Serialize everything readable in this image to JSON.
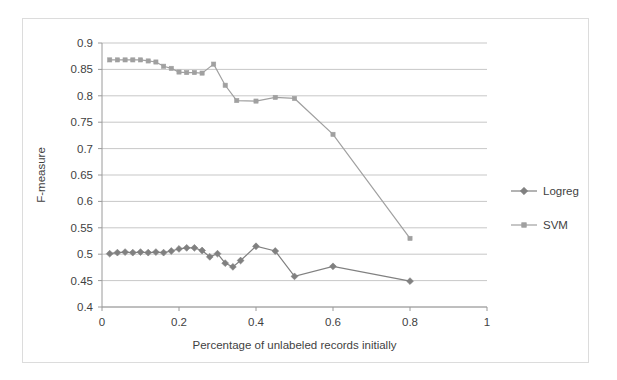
{
  "chart_data": {
    "type": "line",
    "title": "",
    "xlabel": "Percentage of unlabeled records initially",
    "ylabel": "F-measure",
    "xlim": [
      0,
      1
    ],
    "ylim": [
      0.4,
      0.9
    ],
    "xticks": [
      "0",
      "0.2",
      "0.4",
      "0.6",
      "0.8",
      "1"
    ],
    "xtick_values": [
      0,
      0.2,
      0.4,
      0.6,
      0.8,
      1
    ],
    "yticks": [
      "0.4",
      "0.45",
      "0.5",
      "0.55",
      "0.6",
      "0.65",
      "0.7",
      "0.75",
      "0.8",
      "0.85",
      "0.9"
    ],
    "ytick_values": [
      0.4,
      0.45,
      0.5,
      0.55,
      0.6,
      0.65,
      0.7,
      0.75,
      0.8,
      0.85,
      0.9
    ],
    "grid": "horizontal",
    "legend_position": "right",
    "series": [
      {
        "name": "Logreg",
        "marker": "diamond",
        "color": "#808080",
        "x": [
          0.02,
          0.04,
          0.06,
          0.08,
          0.1,
          0.12,
          0.14,
          0.16,
          0.18,
          0.2,
          0.22,
          0.24,
          0.26,
          0.28,
          0.3,
          0.32,
          0.34,
          0.36,
          0.4,
          0.45,
          0.5,
          0.6,
          0.8
        ],
        "y": [
          0.501,
          0.503,
          0.504,
          0.503,
          0.504,
          0.503,
          0.504,
          0.503,
          0.506,
          0.51,
          0.512,
          0.512,
          0.507,
          0.495,
          0.501,
          0.483,
          0.476,
          0.488,
          0.515,
          0.506,
          0.458,
          0.477,
          0.449
        ]
      },
      {
        "name": "SVM",
        "marker": "square",
        "color": "#a0a0a0",
        "x": [
          0.02,
          0.04,
          0.06,
          0.08,
          0.1,
          0.12,
          0.14,
          0.16,
          0.18,
          0.2,
          0.22,
          0.24,
          0.26,
          0.29,
          0.32,
          0.35,
          0.4,
          0.45,
          0.5,
          0.6,
          0.8
        ],
        "y": [
          0.868,
          0.868,
          0.868,
          0.868,
          0.868,
          0.866,
          0.864,
          0.856,
          0.852,
          0.845,
          0.844,
          0.844,
          0.843,
          0.86,
          0.82,
          0.791,
          0.79,
          0.797,
          0.795,
          0.727,
          0.53
        ]
      }
    ]
  },
  "legend": {
    "items": [
      {
        "label": "Logreg",
        "marker": "diamond"
      },
      {
        "label": "SVM",
        "marker": "square"
      }
    ]
  }
}
